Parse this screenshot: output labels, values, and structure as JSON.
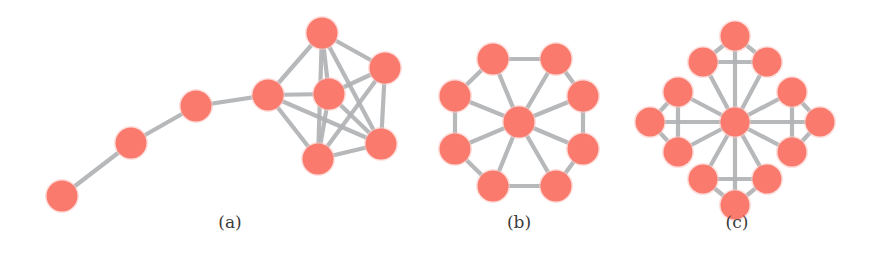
{
  "figure": {
    "name": "three-network-topology-diagrams",
    "background": "#ffffff",
    "node_color": "#fa7a6e",
    "edge_color": "#b0b2b5",
    "width": 888,
    "height": 278
  },
  "panels": [
    {
      "id": "a",
      "caption": "(a)",
      "caption_x": 230,
      "caption_y": 228,
      "description": "path of four nodes attached to a dense six-node clique",
      "node_radius": 15.5,
      "nodes": [
        {
          "id": "a0",
          "x": 62,
          "y": 196
        },
        {
          "id": "a1",
          "x": 131,
          "y": 143
        },
        {
          "id": "a2",
          "x": 196,
          "y": 106
        },
        {
          "id": "a3",
          "x": 268,
          "y": 95
        },
        {
          "id": "a4",
          "x": 322,
          "y": 33
        },
        {
          "id": "a5",
          "x": 385,
          "y": 68
        },
        {
          "id": "a6",
          "x": 329,
          "y": 94
        },
        {
          "id": "a7",
          "x": 381,
          "y": 144
        },
        {
          "id": "a8",
          "x": 318,
          "y": 159
        }
      ],
      "edges": [
        [
          "a0",
          "a1"
        ],
        [
          "a1",
          "a2"
        ],
        [
          "a2",
          "a3"
        ],
        [
          "a3",
          "a4"
        ],
        [
          "a3",
          "a6"
        ],
        [
          "a3",
          "a8"
        ],
        [
          "a3",
          "a7"
        ],
        [
          "a4",
          "a5"
        ],
        [
          "a4",
          "a6"
        ],
        [
          "a4",
          "a8"
        ],
        [
          "a4",
          "a7"
        ],
        [
          "a5",
          "a6"
        ],
        [
          "a5",
          "a7"
        ],
        [
          "a5",
          "a8"
        ],
        [
          "a6",
          "a7"
        ],
        [
          "a6",
          "a8"
        ],
        [
          "a7",
          "a8"
        ]
      ]
    },
    {
      "id": "b",
      "caption": "(b)",
      "caption_x": 519,
      "caption_y": 228,
      "description": "wheel graph: eight-node ring with a central hub",
      "node_radius": 15.5,
      "hub": {
        "id": "b0",
        "x": 519,
        "y": 122
      },
      "ring_center": {
        "x": 519,
        "y": 122
      },
      "ring_radius": 68,
      "ring_count": 8,
      "ring_start_angle": -112.5,
      "nodes": [
        {
          "id": "b0",
          "x": 519,
          "y": 122
        },
        {
          "id": "b1",
          "x": 493,
          "y": 59
        },
        {
          "id": "b2",
          "x": 556,
          "y": 59
        },
        {
          "id": "b3",
          "x": 583,
          "y": 96
        },
        {
          "id": "b4",
          "x": 583,
          "y": 149
        },
        {
          "id": "b5",
          "x": 556,
          "y": 186
        },
        {
          "id": "b6",
          "x": 493,
          "y": 186
        },
        {
          "id": "b7",
          "x": 455,
          "y": 149
        },
        {
          "id": "b8",
          "x": 455,
          "y": 96
        }
      ],
      "edges": [
        [
          "b0",
          "b1"
        ],
        [
          "b0",
          "b2"
        ],
        [
          "b0",
          "b3"
        ],
        [
          "b0",
          "b4"
        ],
        [
          "b0",
          "b5"
        ],
        [
          "b0",
          "b6"
        ],
        [
          "b0",
          "b7"
        ],
        [
          "b0",
          "b8"
        ],
        [
          "b1",
          "b2"
        ],
        [
          "b2",
          "b3"
        ],
        [
          "b3",
          "b4"
        ],
        [
          "b4",
          "b5"
        ],
        [
          "b5",
          "b6"
        ],
        [
          "b6",
          "b7"
        ],
        [
          "b7",
          "b8"
        ],
        [
          "b8",
          "b1"
        ]
      ]
    },
    {
      "id": "c",
      "caption": "(c)",
      "caption_x": 737,
      "caption_y": 228,
      "description": "central hub with four diamond-shaped arm clusters",
      "node_radius": 14.5,
      "hub": {
        "id": "c0",
        "x": 735,
        "y": 122
      },
      "nodes": [
        {
          "id": "c0",
          "x": 735,
          "y": 122
        },
        {
          "id": "cN",
          "x": 735,
          "y": 36
        },
        {
          "id": "cNW",
          "x": 703,
          "y": 62
        },
        {
          "id": "cNE",
          "x": 767,
          "y": 62
        },
        {
          "id": "cS",
          "x": 735,
          "y": 205
        },
        {
          "id": "cSW",
          "x": 703,
          "y": 179
        },
        {
          "id": "cSE",
          "x": 767,
          "y": 179
        },
        {
          "id": "cW",
          "x": 650,
          "y": 122
        },
        {
          "id": "cWN",
          "x": 678,
          "y": 92
        },
        {
          "id": "cWS",
          "x": 678,
          "y": 152
        },
        {
          "id": "cE",
          "x": 820,
          "y": 122
        },
        {
          "id": "cEN",
          "x": 792,
          "y": 92
        },
        {
          "id": "cES",
          "x": 792,
          "y": 152
        }
      ],
      "edges": [
        [
          "c0",
          "cN"
        ],
        [
          "c0",
          "cNW"
        ],
        [
          "c0",
          "cNE"
        ],
        [
          "c0",
          "cS"
        ],
        [
          "c0",
          "cSW"
        ],
        [
          "c0",
          "cSE"
        ],
        [
          "c0",
          "cW"
        ],
        [
          "c0",
          "cWN"
        ],
        [
          "c0",
          "cWS"
        ],
        [
          "c0",
          "cE"
        ],
        [
          "c0",
          "cEN"
        ],
        [
          "c0",
          "cES"
        ],
        [
          "cN",
          "cNW"
        ],
        [
          "cN",
          "cNE"
        ],
        [
          "cNW",
          "cNE"
        ],
        [
          "cS",
          "cSW"
        ],
        [
          "cS",
          "cSE"
        ],
        [
          "cSW",
          "cSE"
        ],
        [
          "cW",
          "cWN"
        ],
        [
          "cW",
          "cWS"
        ],
        [
          "cWN",
          "cWS"
        ],
        [
          "cE",
          "cEN"
        ],
        [
          "cE",
          "cES"
        ],
        [
          "cEN",
          "cES"
        ]
      ]
    }
  ]
}
